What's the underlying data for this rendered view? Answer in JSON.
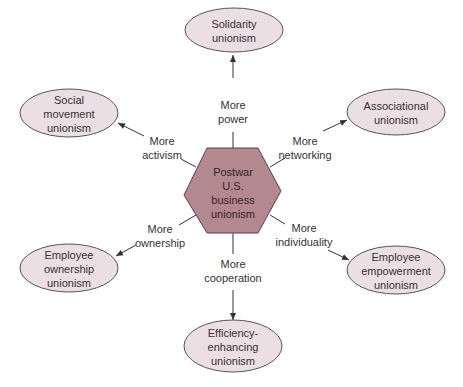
{
  "diagram": {
    "center": {
      "lines": [
        "Postwar",
        "U.S.",
        "business",
        "unionism"
      ],
      "fill": "#b4888f"
    },
    "node_fill": "#ecdfe3",
    "nodes": [
      {
        "id": "solidarity",
        "lines": [
          "Solidarity",
          "unionism"
        ],
        "edge_lines": [
          "More",
          "power"
        ]
      },
      {
        "id": "associational",
        "lines": [
          "Associational",
          "unionism"
        ],
        "edge_lines": [
          "More",
          "networking"
        ]
      },
      {
        "id": "employee-empowerment",
        "lines": [
          "Employee",
          "empowerment",
          "unionism"
        ],
        "edge_lines": [
          "More",
          "individuality"
        ]
      },
      {
        "id": "efficiency-enhancing",
        "lines": [
          "Efficiency-",
          "enhancing",
          "unionism"
        ],
        "edge_lines": [
          "More",
          "cooperation"
        ]
      },
      {
        "id": "employee-ownership",
        "lines": [
          "Employee",
          "ownership",
          "unionism"
        ],
        "edge_lines": [
          "More",
          "ownership"
        ]
      },
      {
        "id": "social-movement",
        "lines": [
          "Social",
          "movement",
          "unionism"
        ],
        "edge_lines": [
          "More",
          "activism"
        ]
      }
    ]
  }
}
